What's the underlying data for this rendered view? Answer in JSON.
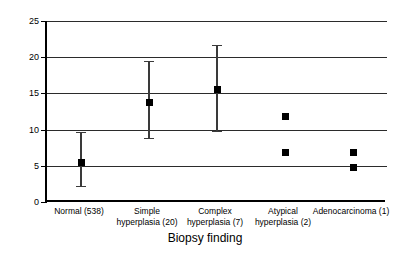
{
  "chart_data": {
    "type": "scatter",
    "title": "",
    "xlabel": "Biopsy finding",
    "ylabel": "Endometrial thickness (mm)",
    "ylim": [
      0,
      25
    ],
    "yticks": [
      0,
      5,
      10,
      15,
      20,
      25
    ],
    "ytick_labels": [
      "0",
      "5",
      "10",
      "15",
      "20",
      "25"
    ],
    "grid": true,
    "legend": "none",
    "categories": [
      "Normal (538)",
      "Simple\nhyperplasia (20)",
      "Complex\nhyperplasia (7)",
      "Atypical\nhyperplasia (2)",
      "Adenocarcinoma (1)"
    ],
    "values": [
      5.5,
      13.8,
      15.5,
      11.8,
      6.8
    ],
    "error_low": [
      2.2,
      8.8,
      9.8,
      null,
      null
    ],
    "error_high": [
      9.7,
      19.5,
      21.7,
      null,
      null
    ],
    "extra_points": [
      {
        "category": "Atypical\nhyperplasia (2)",
        "value": 6.8
      },
      {
        "category": "Adenocarcinoma (1)",
        "value": 4.8
      }
    ],
    "marker_color": "#000000",
    "errorbar_color": "#3a3a3a",
    "gridline_color": "#2b2b2b",
    "axis_color": "#000000"
  },
  "axis": {
    "y_title": "Endometrial thickness (mm)",
    "x_title": "Biopsy finding"
  }
}
